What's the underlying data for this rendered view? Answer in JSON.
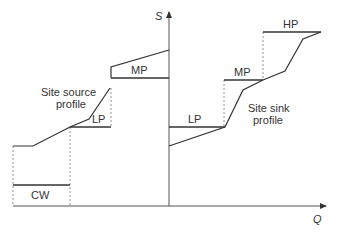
{
  "diagram": {
    "axes": {
      "y_label": "S",
      "x_label": "Q"
    },
    "source": {
      "label_line1": "Site source",
      "label_line2": "profile",
      "levels": {
        "mp": "MP",
        "lp": "LP",
        "cw": "CW"
      }
    },
    "sink": {
      "label_line1": "Site sink",
      "label_line2": "profile",
      "levels": {
        "lp": "LP",
        "mp": "MP",
        "hp": "HP"
      }
    },
    "colors": {
      "line": "#333333",
      "axis": "#555555",
      "dash": "#777777"
    }
  }
}
